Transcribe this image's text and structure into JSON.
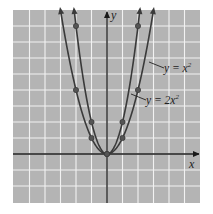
{
  "chart_data": {
    "type": "line",
    "title": "",
    "xlabel": "x",
    "ylabel": "y",
    "grid": true,
    "xlim": [
      -6,
      6
    ],
    "ylim": [
      -3,
      9.3
    ],
    "series": [
      {
        "name": "y = x²",
        "label_main": "y = x",
        "label_exp": "2",
        "function": "x^2",
        "points": [
          [
            -2,
            4
          ],
          [
            -1,
            1
          ],
          [
            0,
            0
          ],
          [
            1,
            1
          ],
          [
            2,
            4
          ]
        ]
      },
      {
        "name": "y = 2x²",
        "label_main": "y = 2x",
        "label_exp": "2",
        "function": "2x^2",
        "points": [
          [
            -2,
            8
          ],
          [
            -1,
            2
          ],
          [
            0,
            0
          ],
          [
            1,
            2
          ],
          [
            2,
            8
          ]
        ]
      }
    ]
  },
  "colors": {
    "grid_background": "#b4b4b4",
    "grid_lines": "#f2f2f2",
    "curves": "#3a3a3a",
    "axes": "#1a1a1a"
  },
  "axes": {
    "x_label": "x",
    "y_label": "y"
  }
}
